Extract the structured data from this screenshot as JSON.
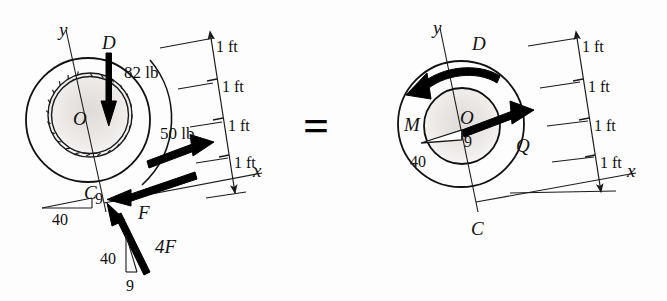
{
  "figure": {
    "type": "free-body-diagram-equivalence",
    "equals_sign": "=",
    "background_color": "#fdfdfd",
    "ink_color": "#111111"
  },
  "left_diagram": {
    "name": "applied-loading-diagram",
    "axis_y_label": "y",
    "axis_x_label": "x",
    "point_labels": {
      "center": "O",
      "top": "D",
      "bottom": "C"
    },
    "forces": [
      {
        "id": "weight",
        "label": "82 lb",
        "direction": "down"
      },
      {
        "id": "cord-pull",
        "label": "50 lb",
        "direction": "up-right"
      },
      {
        "id": "friction",
        "label": "F",
        "direction": "left"
      },
      {
        "id": "normal",
        "label": "4F",
        "direction": "up-left-steep"
      }
    ],
    "slope_triangles": [
      {
        "id": "slope-at-C",
        "rise": "9",
        "run": "40"
      },
      {
        "id": "slope-at-4F",
        "rise": "9",
        "run": "40"
      }
    ],
    "dimensions": {
      "unit_labels": [
        "1 ft",
        "1 ft",
        "1 ft",
        "1 ft"
      ]
    }
  },
  "right_diagram": {
    "name": "resultant-equivalent-diagram",
    "axis_y_label": "y",
    "axis_x_label": "x",
    "point_labels": {
      "center": "O",
      "top": "D",
      "bottom": "C"
    },
    "resultants": [
      {
        "id": "couple-moment",
        "label": "M",
        "direction": "counterclockwise"
      },
      {
        "id": "resultant-force",
        "label": "Q",
        "direction": "up-right"
      }
    ],
    "slope_triangles": [
      {
        "id": "slope-at-O",
        "rise": "9",
        "run": "40"
      }
    ],
    "dimensions": {
      "unit_labels": [
        "1 ft",
        "1 ft",
        "1 ft",
        "1 ft"
      ]
    }
  }
}
